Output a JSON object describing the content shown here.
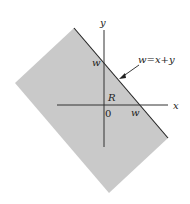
{
  "diagram": {
    "region": {
      "label": "R",
      "fill": "#c9c9c9"
    },
    "boundary_line": {
      "label": "w=x+y",
      "color": "#222222"
    },
    "axes": {
      "x_label": "x",
      "y_label": "y",
      "origin_label": "0"
    },
    "intercepts": {
      "y_intercept_label": "w",
      "x_intercept_label": "w"
    }
  }
}
